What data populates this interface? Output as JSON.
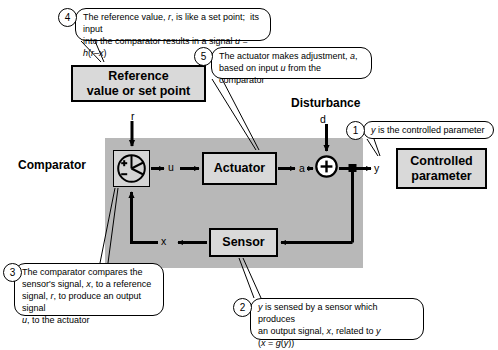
{
  "diagram": {
    "blocks": {
      "reference": "Reference\nvalue or set point",
      "reference_line1": "Reference",
      "reference_line2": "value or set point",
      "actuator": "Actuator",
      "sensor": "Sensor",
      "controlled_line1": "Controlled",
      "controlled_line2": "parameter"
    },
    "labels": {
      "comparator": "Comparator",
      "disturbance": "Disturbance"
    },
    "signals": {
      "r": "r",
      "u": "u",
      "a": "a",
      "d": "d",
      "y": "y",
      "x": "x"
    },
    "comparator_signs": {
      "plus": "+",
      "minus": "−"
    },
    "summing_junction_sign": "+",
    "colors": {
      "plant_panel": "#b8b8b8",
      "block_fill": "#d9d9d9",
      "comparator_fill": "#d4d4d4",
      "line": "#000000",
      "callout_fill": "#ffffff"
    }
  },
  "callouts": [
    {
      "number": "1",
      "text_html": "<i>y</i> is the controlled parameter",
      "text": "y is the controlled parameter",
      "points_to": "y-output-signal"
    },
    {
      "number": "2",
      "text_html": "<i>y</i> is sensed by a sensor which produces<br>an output signal, <i>x</i>, related to <i>y</i><br>(<i>x</i> = <i>g</i>(<i>y</i>))",
      "text": "y is sensed by a sensor which produces an output signal, x, related to y (x = g(y))",
      "points_to": "sensor-block"
    },
    {
      "number": "3",
      "text_html": "The comparator compares the<br>sensor's signal, <i>x</i>, to a reference<br>signal, <i>r</i>, to produce an output signal<br><i>u</i>, to the actuator",
      "text": "The comparator compares the sensor's signal, x, to a reference signal, r, to produce an output signal u, to the actuator",
      "points_to": "comparator"
    },
    {
      "number": "4",
      "text_html": "The reference value, <i>r</i>, is like a set point;&nbsp; its input<br>into the comparator results in a signal <i>u</i> = <i>h</i>(<i>r</i>–<i>x</i>)",
      "text": "The reference value, r, is like a set point; its input into the comparator results in a signal u = h(r–x)",
      "points_to": "reference-block"
    },
    {
      "number": "5",
      "text_html": "The actuator makes adjustment, <i>a</i>,<br>based on input <i>u</i> from the comparator",
      "text": "The actuator makes adjustment, a, based on input u from the comparator",
      "points_to": "actuator-block"
    }
  ]
}
